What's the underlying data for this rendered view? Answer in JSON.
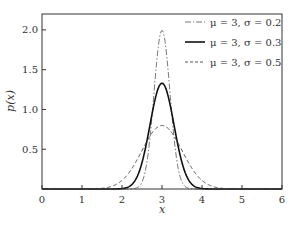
{
  "chart_data": {
    "type": "line",
    "title": "",
    "xlabel": "x",
    "ylabel": "p(x)",
    "xlim": [
      0,
      6
    ],
    "ylim": [
      0,
      2.2
    ],
    "xticks": [
      0,
      1,
      2,
      3,
      4,
      5,
      6
    ],
    "xtick_labels": [
      "0",
      "1",
      "2",
      "3",
      "4",
      "5",
      "6"
    ],
    "yticks": [
      0.5,
      1.0,
      1.5,
      2.0
    ],
    "ytick_labels": [
      "0.5",
      "1.0",
      "1.5",
      "2.0"
    ],
    "grid": false,
    "legend_position": "upper right",
    "series": [
      {
        "name": "μ=3, σ=0.2",
        "mu": 3,
        "sigma": 0.2,
        "style": "dashdot",
        "color": "#555555",
        "width": 0.8,
        "peak": 1.995
      },
      {
        "name": "μ=3, σ=0.3",
        "mu": 3,
        "sigma": 0.3,
        "style": "solid",
        "color": "#111111",
        "width": 1.6,
        "peak": 1.33
      },
      {
        "name": "μ=3, σ=0.5",
        "mu": 3,
        "sigma": 0.5,
        "style": "dashed",
        "color": "#444444",
        "width": 0.9,
        "peak": 0.798
      }
    ]
  },
  "legend": {
    "items": [
      "μ = 3,  σ = 0.2",
      "μ = 3,  σ = 0.3",
      "μ = 3,  σ = 0.5"
    ]
  },
  "labels": {
    "xlabel": "x",
    "ylabel": "p(x)"
  }
}
